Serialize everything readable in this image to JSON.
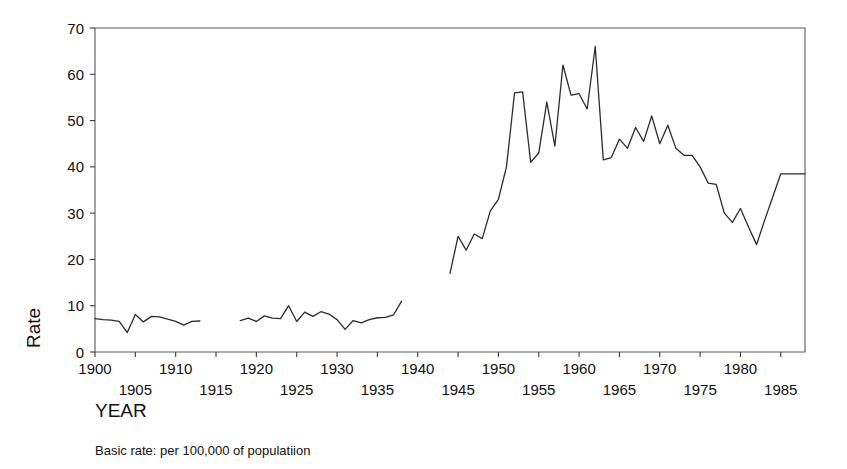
{
  "chart_data": {
    "type": "line",
    "title": "",
    "xlabel": "YEAR",
    "ylabel": "Rate",
    "caption": "Basic rate: per 100,000 of populatiion",
    "xlim": [
      1900,
      1988
    ],
    "ylim": [
      0,
      70
    ],
    "grid": false,
    "legend": null,
    "y_ticks": [
      0,
      10,
      20,
      30,
      40,
      50,
      60,
      70
    ],
    "y_tick_labels": [
      "0",
      "10",
      "20",
      "30",
      "40",
      "50",
      "60",
      "70"
    ],
    "x_ticks": [
      1900,
      1905,
      1910,
      1915,
      1920,
      1925,
      1930,
      1935,
      1940,
      1945,
      1950,
      1955,
      1960,
      1965,
      1970,
      1975,
      1980,
      1985
    ],
    "x_tick_labels_upper": [
      "1900",
      "1910",
      "1920",
      "1930",
      "1940",
      "1950",
      "1960",
      "1970",
      "1980"
    ],
    "x_tick_labels_lower": [
      "1905",
      "1915",
      "1925",
      "1935",
      "1945",
      "1955",
      "1965",
      "1975",
      "1985"
    ],
    "x_minor_ticks": [
      1900,
      1905,
      1910,
      1915,
      1920,
      1925,
      1930,
      1935,
      1940,
      1945,
      1950,
      1955,
      1960,
      1965,
      1970,
      1975,
      1980,
      1985
    ],
    "series": [
      {
        "name": "Rate per 100,000",
        "color": "#2b2b2b",
        "segments": [
          {
            "name": "1900-1913",
            "x": [
              1900,
              1901,
              1902,
              1903,
              1904,
              1905,
              1906,
              1907,
              1908,
              1909,
              1910,
              1911,
              1912,
              1913
            ],
            "y": [
              7.2,
              7.0,
              6.9,
              6.6,
              4.2,
              8.1,
              6.5,
              7.7,
              7.6,
              7.1,
              6.6,
              5.8,
              6.6,
              6.7
            ]
          },
          {
            "name": "1918-1938",
            "x": [
              1918,
              1919,
              1920,
              1921,
              1922,
              1923,
              1924,
              1925,
              1926,
              1927,
              1928,
              1929,
              1930,
              1931,
              1932,
              1933,
              1934,
              1935,
              1936,
              1937,
              1938
            ],
            "y": [
              6.8,
              7.3,
              6.6,
              7.8,
              7.3,
              7.2,
              10.0,
              6.6,
              8.6,
              7.7,
              8.7,
              8.2,
              7.0,
              4.9,
              6.8,
              6.3,
              7.0,
              7.4,
              7.5,
              8.0,
              11.0
            ]
          },
          {
            "name": "1944-1988",
            "x": [
              1944,
              1945,
              1946,
              1947,
              1948,
              1949,
              1950,
              1951,
              1952,
              1953,
              1954,
              1955,
              1956,
              1957,
              1958,
              1959,
              1960,
              1961,
              1962,
              1963,
              1964,
              1965,
              1966,
              1967,
              1968,
              1969,
              1970,
              1971,
              1972,
              1973,
              1974,
              1975,
              1976,
              1977,
              1978,
              1979,
              1980,
              1981,
              1982,
              1983,
              1984,
              1985,
              1986,
              1987,
              1988
            ],
            "y": [
              17.0,
              25.0,
              22.0,
              25.5,
              24.5,
              30.5,
              33.0,
              40.0,
              56.0,
              56.2,
              41.0,
              43.0,
              54.0,
              44.5,
              62.0,
              55.5,
              55.8,
              52.5,
              66.0,
              41.5,
              42.0,
              46.0,
              44.0,
              48.5,
              45.5,
              51.0,
              45.0,
              49.0,
              44.0,
              42.5,
              42.5,
              40.0,
              36.5,
              36.2,
              30.0,
              28.0,
              31.0,
              27.0,
              23.2,
              28.5,
              33.5,
              38.5,
              38.5,
              38.5,
              38.5
            ]
          }
        ]
      }
    ],
    "notes": {
      "gap_1": "1914-1917 (no data)",
      "gap_2": "1939-1943 (no data)"
    }
  }
}
